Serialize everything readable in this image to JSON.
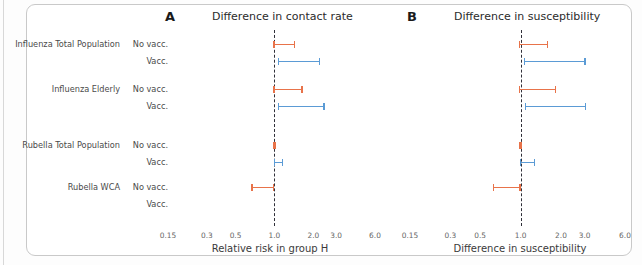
{
  "figure": {
    "width": 642,
    "height": 265,
    "colors": {
      "no_vacc": "#e8734a",
      "vacc": "#5b9bd5",
      "refline": "#2f2f38",
      "text": "#4a4a4a"
    }
  },
  "rows": [
    {
      "group": "Influenza Total Population",
      "vacc_status": "No vacc."
    },
    {
      "group": "",
      "vacc_status": "Vacc."
    },
    {
      "group": "Influenza Elderly",
      "vacc_status": "No vacc."
    },
    {
      "group": "",
      "vacc_status": "Vacc."
    },
    {
      "group": "Rubella Total Population",
      "vacc_status": "No vacc."
    },
    {
      "group": "",
      "vacc_status": "Vacc."
    },
    {
      "group": "Rubella WCA",
      "vacc_status": "No vacc."
    },
    {
      "group": "",
      "vacc_status": "Vacc."
    }
  ],
  "panels": [
    {
      "letter": "A",
      "title": "Difference in contact rate",
      "xlabel": "Relative risk in group H",
      "ticks": [
        "0.15",
        "0.3",
        "0.5",
        "1.0",
        "2.0",
        "3.0",
        "6.0"
      ]
    },
    {
      "letter": "B",
      "title": "Difference in susceptibility",
      "xlabel": "Difference in susceptibility",
      "ticks": [
        "0.15",
        "0.3",
        "0.5",
        "1.0",
        "2.0",
        "3.0",
        "6.0"
      ]
    }
  ],
  "chart_data": {
    "type": "errorbar",
    "xscale": "log",
    "xlim": [
      0.15,
      6.0
    ],
    "xticks": [
      0.15,
      0.3,
      0.5,
      1.0,
      2.0,
      3.0,
      6.0
    ],
    "reference_line": 1.0,
    "grid": false,
    "legend": null,
    "categories": [
      "Influenza Total Population - No vacc.",
      "Influenza Total Population - Vacc.",
      "Influenza Elderly - No vacc.",
      "Influenza Elderly - Vacc.",
      "Rubella Total Population - No vacc.",
      "Rubella Total Population - Vacc.",
      "Rubella WCA - No vacc.",
      "Rubella WCA - Vacc."
    ],
    "panels": [
      {
        "letter": "A",
        "title": "Difference in contact rate",
        "xlabel": "Relative risk in group H",
        "intervals": [
          {
            "label": "Influenza Total Population - No vacc.",
            "series": "No vacc.",
            "low": 0.98,
            "high": 1.45,
            "color": "#e8734a"
          },
          {
            "label": "Influenza Total Population - Vacc.",
            "series": "Vacc.",
            "low": 1.06,
            "high": 2.25,
            "color": "#5b9bd5"
          },
          {
            "label": "Influenza Elderly - No vacc.",
            "series": "No vacc.",
            "low": 0.98,
            "high": 1.65,
            "color": "#e8734a"
          },
          {
            "label": "Influenza Elderly - Vacc.",
            "series": "Vacc.",
            "low": 1.06,
            "high": 2.45,
            "color": "#5b9bd5"
          },
          {
            "label": "Rubella Total Population - No vacc.",
            "series": "No vacc.",
            "low": 0.98,
            "high": 1.02,
            "color": "#e8734a"
          },
          {
            "label": "Rubella Total Population - Vacc.",
            "series": "Vacc.",
            "low": 0.99,
            "high": 1.17,
            "color": "#5b9bd5"
          },
          {
            "label": "Rubella WCA - No vacc.",
            "series": "No vacc.",
            "low": 0.66,
            "high": 1.0,
            "color": "#e8734a"
          },
          {
            "label": "Rubella WCA - Vacc.",
            "series": "Vacc.",
            "low": null,
            "high": null,
            "color": "#5b9bd5"
          }
        ]
      },
      {
        "letter": "B",
        "title": "Difference in susceptibility",
        "xlabel": "Difference in susceptibility",
        "intervals": [
          {
            "label": "Influenza Total Population - No vacc.",
            "series": "No vacc.",
            "low": 0.97,
            "high": 1.6,
            "color": "#e8734a"
          },
          {
            "label": "Influenza Total Population - Vacc.",
            "series": "Vacc.",
            "low": 1.06,
            "high": 3.05,
            "color": "#5b9bd5"
          },
          {
            "label": "Influenza Elderly - No vacc.",
            "series": "No vacc.",
            "low": 0.97,
            "high": 1.85,
            "color": "#e8734a"
          },
          {
            "label": "Influenza Elderly - Vacc.",
            "series": "Vacc.",
            "low": 1.07,
            "high": 3.1,
            "color": "#5b9bd5"
          },
          {
            "label": "Rubella Total Population - No vacc.",
            "series": "No vacc.",
            "low": 0.98,
            "high": 1.02,
            "color": "#e8734a"
          },
          {
            "label": "Rubella Total Population - Vacc.",
            "series": "Vacc.",
            "low": 0.99,
            "high": 1.29,
            "color": "#5b9bd5"
          },
          {
            "label": "Rubella WCA - No vacc.",
            "series": "No vacc.",
            "low": 0.62,
            "high": 1.0,
            "color": "#e8734a"
          },
          {
            "label": "Rubella WCA - Vacc.",
            "series": "Vacc.",
            "low": null,
            "high": null,
            "color": "#5b9bd5"
          }
        ]
      }
    ]
  }
}
